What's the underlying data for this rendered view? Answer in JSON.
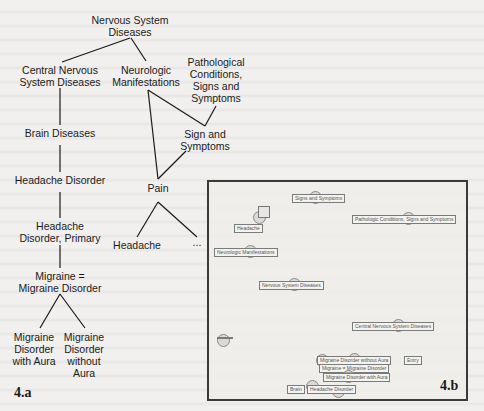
{
  "figure_a": {
    "label": "4.a",
    "nodes": {
      "nervous_system_diseases": "Nervous System\nDiseases",
      "central_nervous_system_diseases": "Central Nervous\nSystem Diseases",
      "neurologic_manifestations": "Neurologic\nManifestations",
      "pathological_conditions": "Pathological\nConditions,\nSigns and\nSymptoms",
      "brain_diseases": "Brain Diseases",
      "sign_and_symptoms": "Sign and\nSymptoms",
      "headache_disorder": "Headache Disorder",
      "pain": "Pain",
      "headache_disorder_primary": "Headache\nDisorder, Primary",
      "headache": "Headache",
      "ellipsis": "...",
      "migraine": "Migraine =\nMigraine Disorder",
      "migraine_with_aura": "Migraine\nDisorder\nwith Aura",
      "migraine_without_aura": "Migraine\nDisorder\nwithout\nAura"
    }
  },
  "figure_b": {
    "label": "4.b",
    "labels": {
      "signs_and_symptoms": "Signs and Symptoms",
      "pathologic_conditions": "Pathologic Conditions, Signs and Symptoms",
      "headache": "Headache",
      "neurologic_manifestations": "Neurologic Manifestations",
      "nervous_system_diseases": "Nervous System Diseases",
      "central_nervous_system_diseases": "Central Nervous System Diseases",
      "unreadable_node": "",
      "migraine_without_aura": "Migraine Disorder without Aura",
      "migraine_equals": "Migraine = Migraine Disorder",
      "entry_tag": "Entry",
      "migraine_with_aura": "Migraine Disorder with Aura",
      "brain": "Brain",
      "headache_disorder": "Headache Disorder"
    },
    "uncertain_readings": [
      "migraine_without_aura",
      "migraine_equals",
      "entry_tag"
    ]
  }
}
